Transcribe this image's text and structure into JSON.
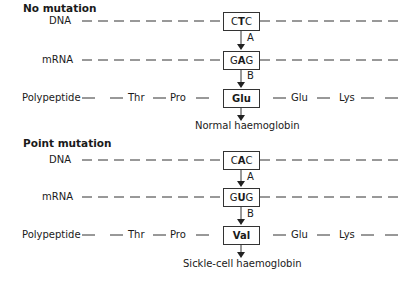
{
  "sections": [
    {
      "title": "No mutation",
      "row_labels": {
        "dna": "DNA",
        "mrna": "mRNA",
        "polypeptide": "Polypeptide"
      },
      "dna_codon": [
        "C",
        "T",
        "C"
      ],
      "dna_bold_index": 1,
      "mrna_codon": [
        "G",
        "A",
        "G"
      ],
      "mrna_bold_index": 1,
      "amino_acid": "Glu",
      "arrow_labels": {
        "a": "A",
        "b": "B"
      },
      "left_residues": [
        "Thr",
        "Pro"
      ],
      "right_residues": [
        "Glu",
        "Lys"
      ],
      "result": "Normal haemoglobin"
    },
    {
      "title": "Point mutation",
      "row_labels": {
        "dna": "DNA",
        "mrna": "mRNA",
        "polypeptide": "Polypeptide"
      },
      "dna_codon": [
        "C",
        "A",
        "C"
      ],
      "dna_bold_index": 1,
      "mrna_codon": [
        "G",
        "U",
        "G"
      ],
      "mrna_bold_index": 1,
      "amino_acid": "Val",
      "arrow_labels": {
        "a": "A",
        "b": "B"
      },
      "left_residues": [
        "Thr",
        "Pro"
      ],
      "right_residues": [
        "Glu",
        "Lys"
      ],
      "result": "Sickle-cell haemoglobin"
    }
  ]
}
